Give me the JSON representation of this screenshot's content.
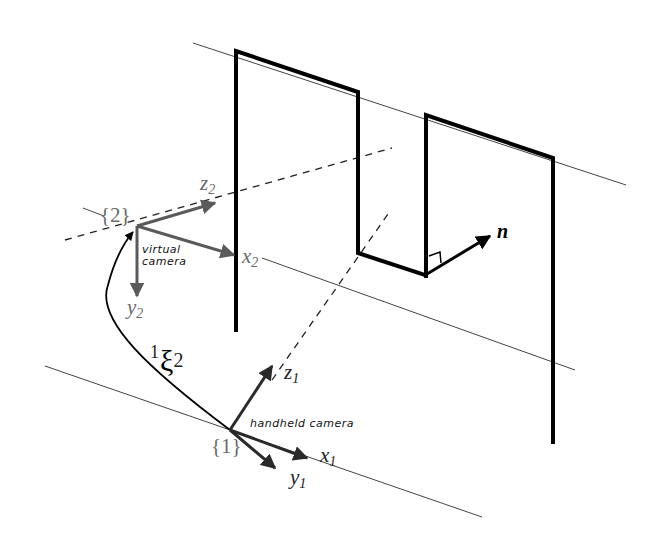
{
  "diagram": {
    "frames": {
      "frame2": {
        "label": "{2}",
        "caption_line1": "virtual",
        "caption_line2": "camera",
        "axes": {
          "x": "x",
          "x_sub": "2",
          "y": "y",
          "y_sub": "2",
          "z": "z",
          "z_sub": "2"
        }
      },
      "frame1": {
        "label": "{1}",
        "caption": "handheld camera",
        "axes": {
          "x": "x",
          "x_sub": "1",
          "y": "y",
          "y_sub": "1",
          "z": "z",
          "z_sub": "1"
        }
      }
    },
    "transform": {
      "superscript": "1",
      "symbol": "ξ",
      "subscript": "2"
    },
    "normal": {
      "label": "n"
    },
    "colors": {
      "frame2_axes": "#5a5a5a",
      "frame1_axes": "#2a2a2a",
      "panel_edges": "#000000",
      "guide_lines": "#444444",
      "background": "#ffffff"
    }
  }
}
